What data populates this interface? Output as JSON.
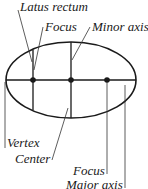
{
  "diagram": {
    "labels": {
      "latus_rectum": "Latus rectum",
      "focus_top": "Focus",
      "minor_axis": "Minor axis",
      "vertex": "Vertex",
      "center": "Center",
      "focus_bottom": "Focus",
      "major_axis": "Major axis"
    },
    "colors": {
      "stroke": "#1a1a1a",
      "background": "#ffffff"
    }
  }
}
